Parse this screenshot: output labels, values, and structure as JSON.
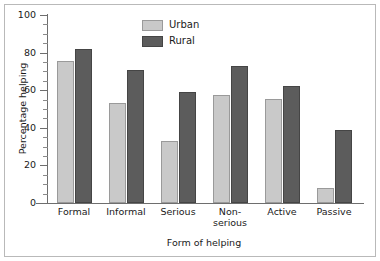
{
  "chart_data": {
    "type": "bar",
    "title": "",
    "subtitle": "",
    "xlabel": "Form of helping",
    "ylabel": "Percentage helping",
    "categories": [
      "Formal",
      "Informal",
      "Serious",
      "Non-\nserious",
      "Active",
      "Passive"
    ],
    "series": [
      {
        "name": "Urban",
        "color": "#c9c9c9",
        "values": [
          75.5,
          53,
          33,
          57.5,
          55.5,
          8
        ]
      },
      {
        "name": "Rural",
        "color": "#5c5c5c",
        "values": [
          82,
          71,
          59,
          73,
          62,
          39
        ]
      }
    ],
    "ylim": [
      0,
      100
    ],
    "ytick_labels": [
      "0",
      "20",
      "40",
      "60",
      "80",
      "100"
    ],
    "ytick_values": [
      0,
      20,
      40,
      60,
      80,
      100
    ],
    "yminor_step": 5,
    "grid": false,
    "legend_position": "top-center",
    "axis_color": "#6e6e6e",
    "background": "#ffffff"
  },
  "legend": {
    "items": [
      {
        "label": "Urban"
      },
      {
        "label": "Rural"
      }
    ]
  }
}
